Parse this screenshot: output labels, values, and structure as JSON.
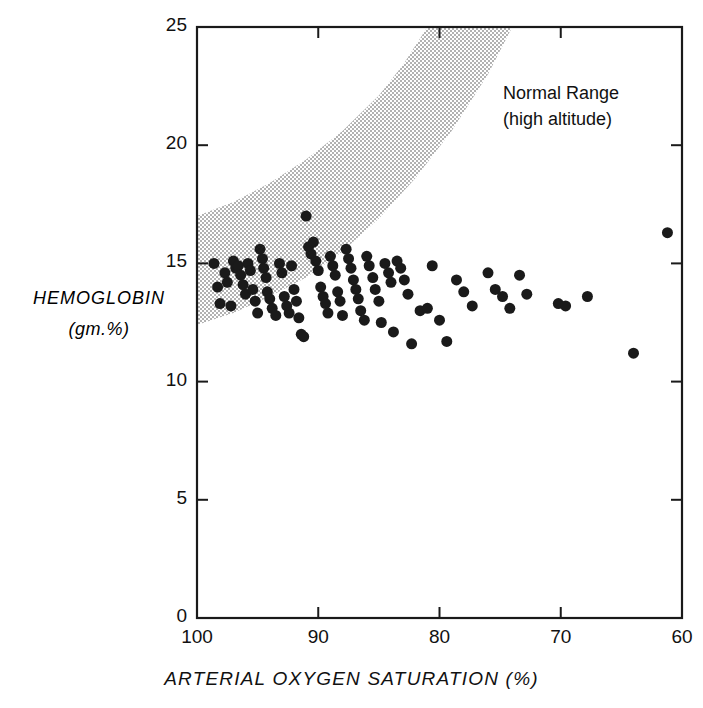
{
  "chart_data": {
    "type": "scatter",
    "title": "",
    "xlabel": "ARTERIAL OXYGEN SATURATION (%)",
    "ylabel_line1": "HEMOGLOBIN",
    "ylabel_line2": "(gm.%)",
    "xlim": [
      100,
      60
    ],
    "ylim": [
      0,
      25
    ],
    "x_inverted": true,
    "grid": false,
    "legend": "none",
    "xticks": [
      100,
      90,
      80,
      70,
      60
    ],
    "xtick_labels": [
      "100",
      "90",
      "80",
      "70",
      "60"
    ],
    "yticks": [
      0,
      5,
      10,
      15,
      20,
      25
    ],
    "ytick_labels": [
      "0",
      "5",
      "10",
      "15",
      "20",
      "25"
    ],
    "marker": "filled-circle",
    "marker_color": "#1a1a1a",
    "marker_size_px": 11,
    "annotations": [
      {
        "name": "normal-range-label",
        "line1": "Normal Range",
        "line2": "(high altitude)",
        "x": 79.5,
        "y": 22.2
      }
    ],
    "bands": [
      {
        "name": "normal-range-high-altitude-band",
        "style": "stippled",
        "description": "Stippled band rising from left to right marking normal hemoglobin range at high altitude",
        "lower_boundary": [
          {
            "x": 100,
            "y": 12.4
          },
          {
            "x": 97,
            "y": 12.9
          },
          {
            "x": 94,
            "y": 13.6
          },
          {
            "x": 91,
            "y": 14.4
          },
          {
            "x": 88,
            "y": 15.5
          },
          {
            "x": 85,
            "y": 16.9
          },
          {
            "x": 82,
            "y": 18.6
          },
          {
            "x": 79,
            "y": 20.6
          },
          {
            "x": 76,
            "y": 23.0
          },
          {
            "x": 74,
            "y": 25.0
          }
        ],
        "upper_boundary": [
          {
            "x": 100,
            "y": 17.0
          },
          {
            "x": 97,
            "y": 17.6
          },
          {
            "x": 94,
            "y": 18.4
          },
          {
            "x": 91,
            "y": 19.4
          },
          {
            "x": 88,
            "y": 20.6
          },
          {
            "x": 85,
            "y": 22.1
          },
          {
            "x": 83,
            "y": 23.4
          },
          {
            "x": 81,
            "y": 25.0
          }
        ]
      }
    ],
    "points": [
      {
        "x": 98.6,
        "y": 15.0
      },
      {
        "x": 98.3,
        "y": 14.0
      },
      {
        "x": 98.1,
        "y": 13.3
      },
      {
        "x": 97.7,
        "y": 14.6
      },
      {
        "x": 97.5,
        "y": 14.2
      },
      {
        "x": 97.2,
        "y": 13.2
      },
      {
        "x": 97.0,
        "y": 15.1
      },
      {
        "x": 96.8,
        "y": 14.8
      },
      {
        "x": 96.6,
        "y": 14.9
      },
      {
        "x": 96.4,
        "y": 14.5
      },
      {
        "x": 96.2,
        "y": 14.1
      },
      {
        "x": 96.0,
        "y": 13.7
      },
      {
        "x": 95.8,
        "y": 15.0
      },
      {
        "x": 95.6,
        "y": 14.7
      },
      {
        "x": 95.4,
        "y": 13.9
      },
      {
        "x": 95.2,
        "y": 13.4
      },
      {
        "x": 95.0,
        "y": 12.9
      },
      {
        "x": 94.8,
        "y": 15.6
      },
      {
        "x": 94.6,
        "y": 15.2
      },
      {
        "x": 94.5,
        "y": 14.8
      },
      {
        "x": 94.3,
        "y": 14.4
      },
      {
        "x": 94.2,
        "y": 13.8
      },
      {
        "x": 94.0,
        "y": 13.5
      },
      {
        "x": 93.8,
        "y": 13.1
      },
      {
        "x": 93.5,
        "y": 12.8
      },
      {
        "x": 93.2,
        "y": 15.0
      },
      {
        "x": 93.0,
        "y": 14.6
      },
      {
        "x": 92.8,
        "y": 13.6
      },
      {
        "x": 92.6,
        "y": 13.2
      },
      {
        "x": 92.4,
        "y": 12.9
      },
      {
        "x": 92.2,
        "y": 14.9
      },
      {
        "x": 92.0,
        "y": 13.9
      },
      {
        "x": 91.8,
        "y": 13.4
      },
      {
        "x": 91.6,
        "y": 12.7
      },
      {
        "x": 91.4,
        "y": 12.0
      },
      {
        "x": 91.2,
        "y": 11.9
      },
      {
        "x": 91.0,
        "y": 17.0
      },
      {
        "x": 90.8,
        "y": 15.7
      },
      {
        "x": 90.6,
        "y": 15.4
      },
      {
        "x": 90.4,
        "y": 15.9
      },
      {
        "x": 90.2,
        "y": 15.1
      },
      {
        "x": 90.0,
        "y": 14.7
      },
      {
        "x": 89.8,
        "y": 14.0
      },
      {
        "x": 89.6,
        "y": 13.6
      },
      {
        "x": 89.4,
        "y": 13.3
      },
      {
        "x": 89.2,
        "y": 12.9
      },
      {
        "x": 89.0,
        "y": 15.3
      },
      {
        "x": 88.8,
        "y": 14.9
      },
      {
        "x": 88.6,
        "y": 14.5
      },
      {
        "x": 88.4,
        "y": 13.8
      },
      {
        "x": 88.2,
        "y": 13.4
      },
      {
        "x": 88.0,
        "y": 12.8
      },
      {
        "x": 87.7,
        "y": 15.6
      },
      {
        "x": 87.5,
        "y": 15.2
      },
      {
        "x": 87.3,
        "y": 14.8
      },
      {
        "x": 87.1,
        "y": 14.3
      },
      {
        "x": 86.9,
        "y": 13.9
      },
      {
        "x": 86.7,
        "y": 13.5
      },
      {
        "x": 86.5,
        "y": 13.0
      },
      {
        "x": 86.2,
        "y": 12.6
      },
      {
        "x": 86.0,
        "y": 15.3
      },
      {
        "x": 85.8,
        "y": 14.9
      },
      {
        "x": 85.5,
        "y": 14.4
      },
      {
        "x": 85.3,
        "y": 13.9
      },
      {
        "x": 85.0,
        "y": 13.4
      },
      {
        "x": 84.8,
        "y": 12.5
      },
      {
        "x": 84.5,
        "y": 15.0
      },
      {
        "x": 84.2,
        "y": 14.6
      },
      {
        "x": 84.0,
        "y": 14.2
      },
      {
        "x": 83.8,
        "y": 12.1
      },
      {
        "x": 83.5,
        "y": 15.1
      },
      {
        "x": 83.2,
        "y": 14.8
      },
      {
        "x": 82.9,
        "y": 14.3
      },
      {
        "x": 82.6,
        "y": 13.7
      },
      {
        "x": 82.3,
        "y": 11.6
      },
      {
        "x": 81.6,
        "y": 13.0
      },
      {
        "x": 81.0,
        "y": 13.1
      },
      {
        "x": 80.6,
        "y": 14.9
      },
      {
        "x": 80.0,
        "y": 12.6
      },
      {
        "x": 79.4,
        "y": 11.7
      },
      {
        "x": 78.6,
        "y": 14.3
      },
      {
        "x": 78.0,
        "y": 13.8
      },
      {
        "x": 77.3,
        "y": 13.2
      },
      {
        "x": 76.0,
        "y": 14.6
      },
      {
        "x": 75.4,
        "y": 13.9
      },
      {
        "x": 74.8,
        "y": 13.6
      },
      {
        "x": 74.2,
        "y": 13.1
      },
      {
        "x": 73.4,
        "y": 14.5
      },
      {
        "x": 72.8,
        "y": 13.7
      },
      {
        "x": 70.2,
        "y": 13.3
      },
      {
        "x": 69.6,
        "y": 13.2
      },
      {
        "x": 67.8,
        "y": 13.6
      },
      {
        "x": 64.0,
        "y": 11.2
      },
      {
        "x": 61.2,
        "y": 16.3
      }
    ]
  },
  "plot": {
    "frame_color": "#1a1a1a",
    "background": "#ffffff",
    "stipple_color": "#3a3a3a"
  }
}
